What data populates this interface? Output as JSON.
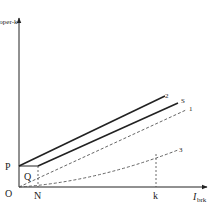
{
  "diagram": {
    "y_axis_label": "I",
    "y_axis_sub": "oper-k",
    "x_axis_label": "I",
    "x_axis_sub": "brk",
    "points": {
      "origin": "O",
      "p": "P",
      "q": "Q",
      "n": "N",
      "k": "k"
    },
    "curves": {
      "line2": "2",
      "lineS": "S",
      "line1": "1",
      "line3": "3"
    },
    "colors": {
      "stroke": "#222222",
      "dashed": "#555555"
    }
  }
}
